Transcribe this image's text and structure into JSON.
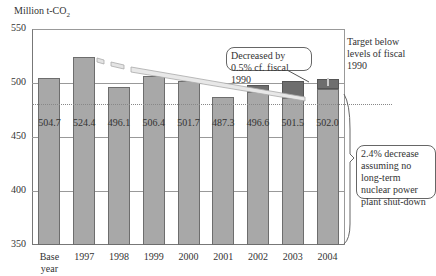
{
  "chart_data": {
    "type": "bar",
    "title": "",
    "ylabel": "Million t-CO2",
    "xlabel": "",
    "ylim": [
      350,
      550
    ],
    "yticks": [
      350,
      400,
      450,
      500,
      550
    ],
    "categories": [
      "Base year",
      "1997",
      "1998",
      "1999",
      "2000",
      "2001",
      "2002",
      "2003",
      "2004"
    ],
    "values": [
      504.7,
      524.4,
      496.1,
      506.4,
      501.7,
      487.3,
      496.6,
      501.5,
      502.0
    ],
    "value_labels": [
      "504.7",
      "524.4",
      "496.1",
      "506.4",
      "501.7",
      "487.3",
      "496.6",
      "501.5",
      "502.0"
    ],
    "stacked_upper_segments": [
      {
        "category": "2002",
        "lower_top": 492,
        "upper_top": 498
      },
      {
        "category": "2003",
        "lower_top": 486,
        "upper_top": 502
      },
      {
        "category": "2004",
        "lower_top": 494,
        "upper_top": 504
      }
    ],
    "reference_line": {
      "value": 504.7,
      "style": "dotted",
      "label": "Target below levels of fiscal 1990"
    },
    "annotations": [
      "Decreased by 0.5% cf. fiscal 1990",
      "2.4% decrease assuming no long-term nuclear power plant shut-down",
      "Target below levels of fiscal 1990"
    ],
    "grid": true,
    "legend": "none"
  },
  "axis": {
    "ylabel_main": "Million t-CO",
    "ylabel_sub": "2",
    "yticks": [
      "550",
      "500",
      "450",
      "400",
      "350"
    ],
    "xticks": [
      "Base\nyear",
      "1997",
      "1998",
      "1999",
      "2000",
      "2001",
      "2002",
      "2003",
      "2004"
    ]
  },
  "labels": {
    "values": [
      "504.7",
      "524.4",
      "496.1",
      "506.4",
      "501.7",
      "487.3",
      "496.6",
      "501.5",
      "502.0"
    ]
  },
  "annotations": {
    "target": "Target below levels of fiscal 1990",
    "decreased": "Decreased by 0.5% cf. fiscal 1990",
    "nuclear": "2.4% decrease assuming no long-term nuclear power plant shut-down"
  },
  "colors": {
    "bar": "#a8a8a8",
    "bar_dark": "#6e6e6e",
    "gridline": "#888888"
  }
}
